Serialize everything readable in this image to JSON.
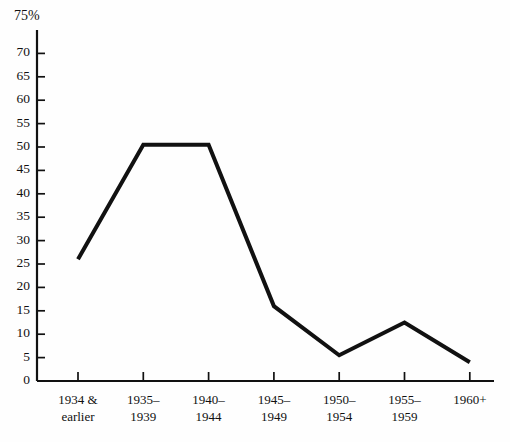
{
  "chart_data": {
    "type": "line",
    "title": "",
    "subtitle": "",
    "xlabel": "",
    "ylabel": "",
    "y_unit_label": "75%",
    "categories": [
      "1934 &\nearlier",
      "1935–\n1939",
      "1940–\n1944",
      "1945–\n1949",
      "1950–\n1954",
      "1955–\n1959",
      "1960+"
    ],
    "values": [
      26,
      50.5,
      50.5,
      16,
      5.5,
      12.5,
      4
    ],
    "ylim": [
      0,
      75
    ],
    "ytick_values": [
      0,
      5,
      10,
      15,
      20,
      25,
      30,
      35,
      40,
      45,
      50,
      55,
      60,
      65,
      70,
      75
    ],
    "ytick_labels": [
      "0",
      "5",
      "10",
      "15",
      "20",
      "25",
      "30",
      "35",
      "40",
      "45",
      "50",
      "55",
      "60",
      "65",
      "70",
      "75%"
    ],
    "grid": false,
    "legend": null,
    "legend_position": "none",
    "series": [
      {
        "name": "percent",
        "values": [
          26,
          50.5,
          50.5,
          16,
          5.5,
          12.5,
          4
        ]
      }
    ],
    "line_color": "#111111",
    "axis_color": "#111111",
    "background_color": "#fefefe"
  }
}
